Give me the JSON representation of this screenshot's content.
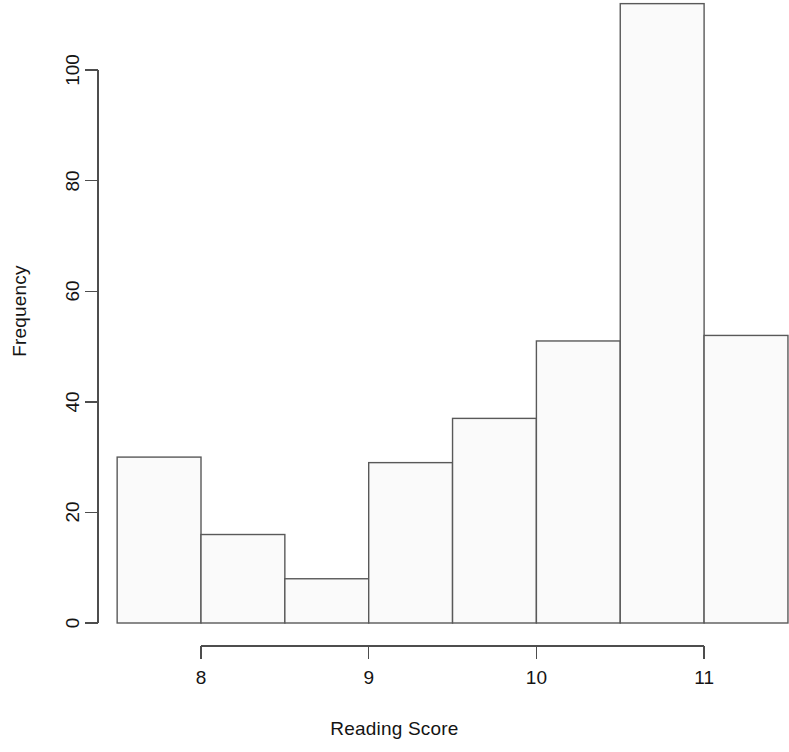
{
  "chart_data": {
    "type": "bar",
    "title": "",
    "subtitle": "",
    "xlabel": "Reading Score",
    "ylabel": "Frequency",
    "grid": false,
    "legend": null,
    "xlim": [
      7.5,
      11.5
    ],
    "ylim": [
      0,
      112
    ],
    "bin_width": 0.5,
    "bin_edges": [
      7.5,
      8.0,
      8.5,
      9.0,
      9.5,
      10.0,
      10.5,
      11.0,
      11.5
    ],
    "categories": [
      "7.5-8.0",
      "8.0-8.5",
      "8.5-9.0",
      "9.0-9.5",
      "9.5-10.0",
      "10.0-10.5",
      "10.5-11.0",
      "11.0-11.5"
    ],
    "values": [
      30,
      16,
      8,
      29,
      37,
      51,
      112,
      52
    ],
    "x_ticks": [
      8,
      9,
      10,
      11
    ],
    "x_tick_labels": [
      "8",
      "9",
      "10",
      "11"
    ],
    "y_ticks": [
      0,
      20,
      40,
      60,
      80,
      100
    ],
    "y_tick_labels": [
      "0",
      "20",
      "40",
      "60",
      "80",
      "100"
    ],
    "bar_fill": "#fafafa",
    "bar_stroke": "#595959",
    "axis_color": "#4d4d4d",
    "background": "#ffffff"
  }
}
